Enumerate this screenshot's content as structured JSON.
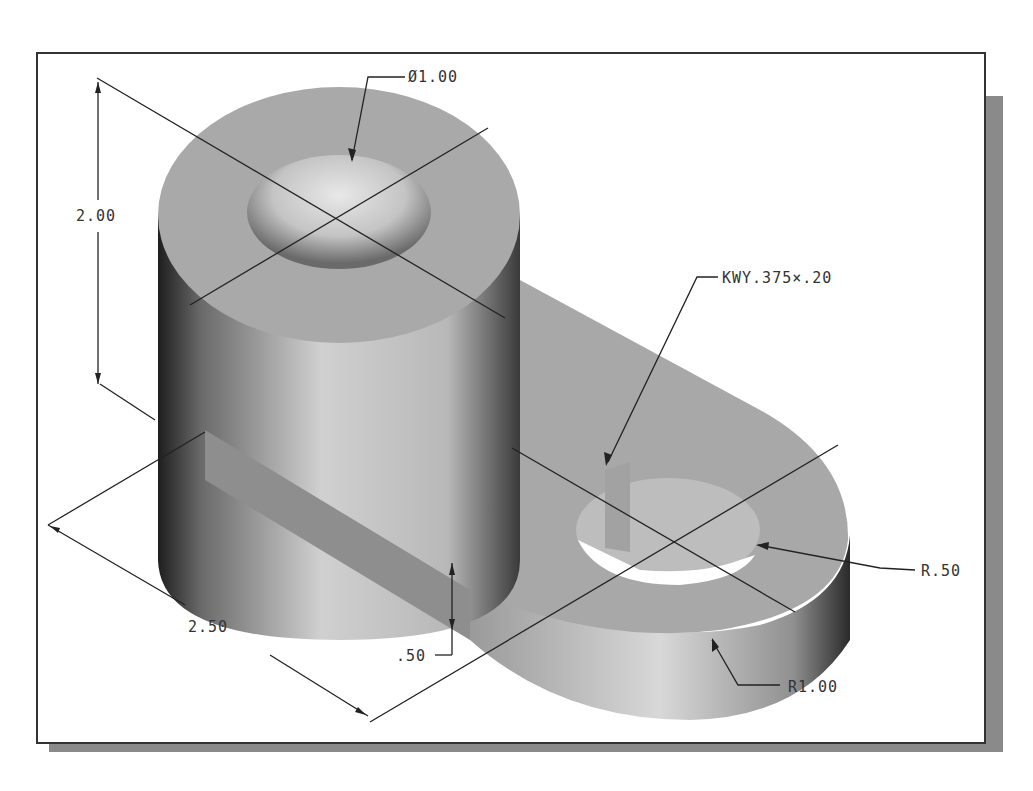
{
  "drawing": {
    "type": "isometric shaded part with dimensions",
    "colors": {
      "background": "#ffffff",
      "frame": "#333333",
      "shadow": "#8a8a8a",
      "part_face": "#a9a9a9",
      "dim_line": "#222222"
    },
    "dimensions": {
      "bore_diameter": "Ø1.00",
      "height": "2.00",
      "keyway": "KWY.375×.20",
      "hole_radius": "R.50",
      "arm_end_radius": "R1.00",
      "length": "2.50",
      "arm_thickness": ".50"
    }
  }
}
